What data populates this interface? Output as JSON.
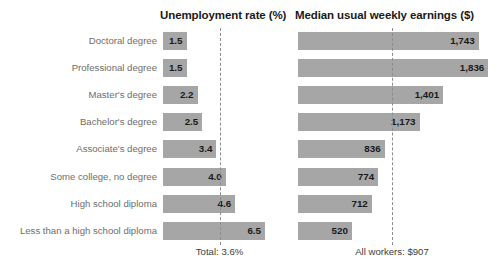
{
  "chart_data": {
    "type": "bar",
    "orientation": "horizontal",
    "grid": false,
    "legend": null,
    "title": "",
    "categories": [
      "Doctoral degree",
      "Professional degree",
      "Master's degree",
      "Bachelor's degree",
      "Associate's degree",
      "Some college, no degree",
      "High school diploma",
      "Less than a high school diploma"
    ],
    "panels": [
      {
        "key": "unemployment",
        "title": "Unemployment rate (%)",
        "xlabel": "",
        "ylabel": "",
        "xlim": [
          0,
          7
        ],
        "values": [
          1.5,
          1.5,
          2.2,
          2.5,
          3.4,
          4.0,
          4.6,
          6.5
        ],
        "value_labels": [
          "1.5",
          "1.5",
          "2.2",
          "2.5",
          "3.4",
          "4.0",
          "4.6",
          "6.5"
        ],
        "reference_value": 3.6,
        "reference_label": "Total: 3.6%"
      },
      {
        "key": "earnings",
        "title": "Median usual weekly earnings ($)",
        "xlabel": "",
        "ylabel": "",
        "xlim": [
          0,
          1900
        ],
        "values": [
          1743,
          1836,
          1401,
          1173,
          836,
          774,
          712,
          520
        ],
        "value_labels": [
          "1,743",
          "1,836",
          "1,401",
          "1,173",
          "836",
          "774",
          "712",
          "520"
        ],
        "reference_value": 907,
        "reference_label": "All workers: $907"
      }
    ],
    "colors": {
      "bar": "#a6a6a6",
      "reference_line": "#8c8c8c",
      "category_label": "#6e6e6e",
      "value_label": "#1a1a1a",
      "title": "#1a1a1a",
      "background": "#ffffff"
    }
  }
}
